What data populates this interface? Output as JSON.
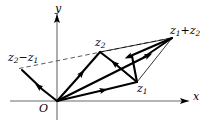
{
  "figure": {
    "width": 209,
    "height": 126,
    "background": "#ffffff",
    "stroke_color": "#000000",
    "dashed_color": "#555555"
  },
  "axes": {
    "x_axis": {
      "label": "x",
      "y_pixel": 101,
      "x_start": 10,
      "x_end": 191,
      "arrow": "right"
    },
    "y_axis": {
      "label": "y",
      "x_pixel": 57,
      "y_start": 118,
      "y_end": 12,
      "arrow": "up"
    },
    "origin": {
      "label": "O",
      "x": 57,
      "y": 101
    }
  },
  "points": [
    {
      "name": "origin",
      "label": "O",
      "x": 57,
      "y": 101
    },
    {
      "name": "z1",
      "label": "z₁",
      "x": 137,
      "y": 82
    },
    {
      "name": "z2",
      "label": "z₂",
      "x": 100,
      "y": 52
    },
    {
      "name": "z1plusz2",
      "label": "z₁+z₂",
      "x": 172,
      "y": 38
    },
    {
      "name": "z2minusz1",
      "label": "z₂−z₁",
      "x": 22,
      "y": 70
    }
  ],
  "labels": {
    "z2_minus_z1": {
      "base": "z",
      "sub1": "2",
      "op": "−",
      "base2": "z",
      "sub2": "1",
      "text": "z2−z1"
    },
    "z2": {
      "base": "z",
      "sub": "2",
      "text": "z2"
    },
    "z1_plus_z2": {
      "base": "z",
      "sub1": "1",
      "op": "+",
      "base2": "z",
      "sub2": "2",
      "text": "z1+z2"
    },
    "z1": {
      "base": "z",
      "sub": "1",
      "text": "z1"
    },
    "origin": {
      "text": "O"
    },
    "x_axis": {
      "text": "x"
    },
    "y_axis": {
      "text": "y"
    }
  },
  "vectors": [
    {
      "name": "vector-O-to-z1",
      "from": "origin",
      "to": "z1",
      "style": "solid-bold",
      "arrowhead": "mid"
    },
    {
      "name": "vector-O-to-z2",
      "from": "origin",
      "to": "z2",
      "style": "solid-bold",
      "arrowhead": "mid"
    },
    {
      "name": "vector-O-to-sum",
      "from": "origin",
      "to": "z1plusz2",
      "style": "solid-bold",
      "arrowhead": "mid"
    },
    {
      "name": "vector-z1-to-sum",
      "from": "z1",
      "to": "z1plusz2",
      "style": "thin",
      "arrowhead": "none"
    },
    {
      "name": "vector-z2-to-sum",
      "from": "z2",
      "to": "z1plusz2",
      "style": "thin",
      "arrowhead": "none"
    },
    {
      "name": "vector-sum-to-z1",
      "from": "z1plusz2",
      "to": "z1",
      "style": "solid-bold",
      "arrowhead": "mid"
    },
    {
      "name": "vector-O-to-z2minusz1",
      "from": "origin",
      "to": "z2minusz1",
      "style": "solid-bold",
      "arrowhead": "mid"
    },
    {
      "name": "vector-z1-to-z2",
      "from": "z1",
      "to": "z2",
      "style": "solid-bold",
      "arrowhead": "mid"
    }
  ],
  "dashed_line": {
    "name": "dashed-parallel-line",
    "from_x": 20,
    "from_y": 68,
    "to_x": 172,
    "to_y": 38
  }
}
